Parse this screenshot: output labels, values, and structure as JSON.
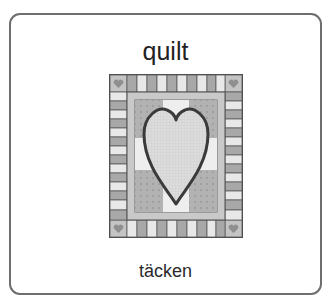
{
  "card": {
    "word_english": "quilt",
    "word_swedish": "täcken",
    "illustration": "quilt-with-heart-icon"
  },
  "colors": {
    "border": "#6e6e6e",
    "text": "#222222",
    "quilt_dark": "#555555",
    "quilt_mid": "#b5b5b5",
    "quilt_light": "#e4e4e4"
  }
}
